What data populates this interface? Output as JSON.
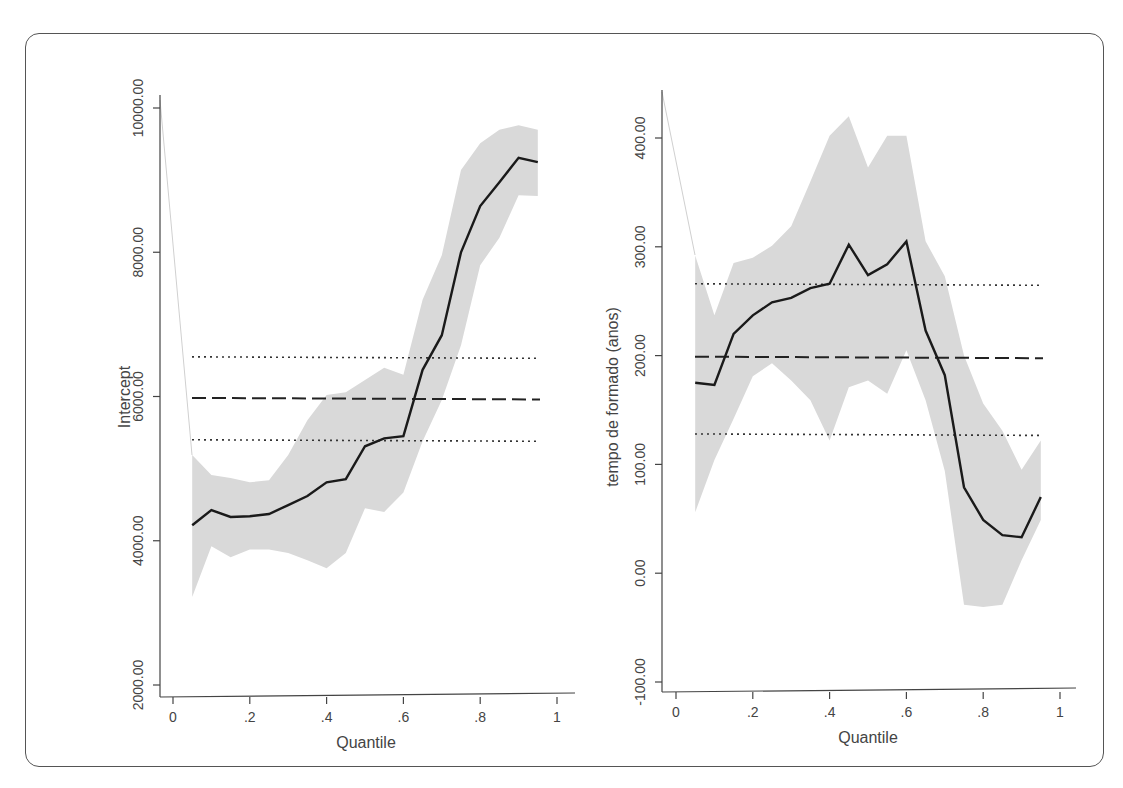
{
  "chart_data": [
    {
      "type": "line",
      "title": "",
      "xlabel": "Quantile",
      "ylabel": "Intercept",
      "xlim": [
        0,
        1
      ],
      "ylim": [
        2000,
        10000
      ],
      "x_ticks": [
        "0",
        ".2",
        ".4",
        ".6",
        ".8",
        "1"
      ],
      "y_ticks": [
        "2000.00",
        "4000.00",
        "6000.00",
        "8000.00",
        "10000.00"
      ],
      "grid": false,
      "x": [
        0.05,
        0.1,
        0.15,
        0.2,
        0.25,
        0.3,
        0.35,
        0.4,
        0.45,
        0.5,
        0.55,
        0.6,
        0.65,
        0.7,
        0.75,
        0.8,
        0.85,
        0.9,
        0.95
      ],
      "series": [
        {
          "name": "Quantile regression coefficient",
          "style": "solid",
          "values": [
            4215,
            4425,
            4330,
            4340,
            4370,
            4495,
            4620,
            4810,
            4855,
            5310,
            5420,
            5450,
            6370,
            6850,
            8000,
            8640,
            8970,
            9310,
            9250
          ]
        },
        {
          "name": "CI upper",
          "style": "band",
          "values": [
            5190,
            4910,
            4870,
            4810,
            4840,
            5190,
            5670,
            6020,
            6060,
            6230,
            6400,
            6300,
            7340,
            7960,
            9140,
            9510,
            9700,
            9760,
            9700
          ]
        },
        {
          "name": "CI lower",
          "style": "band",
          "values": [
            3220,
            3925,
            3770,
            3880,
            3880,
            3830,
            3730,
            3620,
            3830,
            4450,
            4400,
            4670,
            5380,
            5950,
            6710,
            7820,
            8200,
            8790,
            8780
          ]
        }
      ],
      "ols": {
        "estimate": 5980,
        "ci_upper": 6550,
        "ci_lower": 5400
      }
    },
    {
      "type": "line",
      "title": "",
      "xlabel": "Quantile",
      "ylabel": "tempo de formado (anos)",
      "xlim": [
        0,
        1
      ],
      "ylim": [
        -100,
        400
      ],
      "x_ticks": [
        "0",
        ".2",
        ".4",
        ".6",
        ".8",
        "1"
      ],
      "y_ticks": [
        "-100.00",
        "0.00",
        "100.00",
        "200.00",
        "300.00",
        "400.00"
      ],
      "grid": false,
      "x": [
        0.05,
        0.1,
        0.15,
        0.2,
        0.25,
        0.3,
        0.35,
        0.4,
        0.45,
        0.5,
        0.55,
        0.6,
        0.65,
        0.7,
        0.75,
        0.8,
        0.85,
        0.9,
        0.95
      ],
      "series": [
        {
          "name": "Quantile regression coefficient",
          "style": "solid",
          "values": [
            175,
            173,
            220,
            237,
            249,
            253,
            262,
            266,
            302,
            274,
            284,
            305,
            223,
            182,
            79,
            49,
            35,
            33,
            70
          ]
        },
        {
          "name": "CI upper",
          "style": "band",
          "values": [
            292,
            237,
            285,
            290,
            301,
            319,
            360,
            402,
            420,
            373,
            402,
            402,
            305,
            273,
            200,
            156,
            131,
            95,
            122
          ]
        },
        {
          "name": "CI lower",
          "style": "band",
          "values": [
            56,
            104,
            142,
            181,
            193,
            177,
            159,
            122,
            171,
            177,
            165,
            205,
            159,
            94,
            -29,
            -31,
            -29,
            12,
            49
          ]
        }
      ],
      "ols": {
        "estimate": 199,
        "ci_upper": 266,
        "ci_lower": 128
      }
    }
  ],
  "panels": [
    {
      "ylabel": "Intercept",
      "xlabel": "Quantile",
      "y_tick_labels": [
        "10000.00",
        "8000.00",
        "6000.00",
        "4000.00",
        "2000.00"
      ],
      "x_tick_labels": [
        "0",
        ".2",
        ".4",
        ".6",
        ".8",
        "1"
      ]
    },
    {
      "ylabel": "tempo de formado (anos)",
      "xlabel": "Quantile",
      "y_tick_labels": [
        "400.00",
        "300.00",
        "200.00",
        "100.00",
        "0.00",
        "-100.00"
      ],
      "x_tick_labels": [
        "0",
        ".2",
        ".4",
        ".6",
        ".8",
        "1"
      ]
    }
  ],
  "colors": {
    "band": "#d9d9d9",
    "line": "#1a1a1a",
    "axis": "#444444",
    "frame": "#555555"
  }
}
